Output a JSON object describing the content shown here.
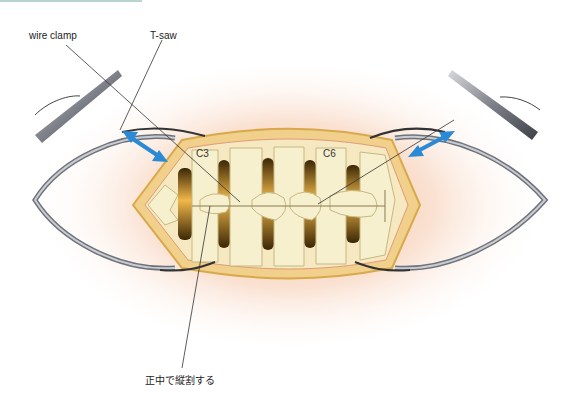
{
  "labels": {
    "wire_clamp": "wire clamp",
    "t_saw": "T-saw",
    "c3": "C3",
    "c6": "C6",
    "midline_split": "正中で縦割する"
  },
  "colors": {
    "skin": "#f6cdb0",
    "bone": "#f3ecc6",
    "bone_shadow": "#c9b57a",
    "dark_gap": "#6a4a1a",
    "tissue_edge": "#e2b65a",
    "retractor": "#8c8f96",
    "arrow": "#2b8ad6",
    "leader_line": "#333333"
  }
}
